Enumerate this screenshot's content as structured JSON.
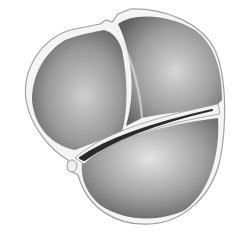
{
  "image": {
    "description": "Grayscale illustration of a rounded three-lobed organic body with white outer membrane and a dark crevice separating lower lobe",
    "colors": {
      "background": "#ffffff",
      "membrane": "#f4f4f4",
      "membrane_edge": "#9a9a9a",
      "lobe_light": "#d8d8d8",
      "lobe_dark": "#6a6a6a",
      "crevice": "#2a2a2a"
    }
  }
}
